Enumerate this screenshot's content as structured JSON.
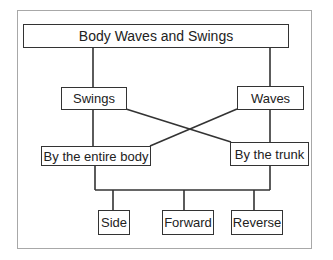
{
  "diagram": {
    "title": "Body Waves and Swings",
    "level1": [
      {
        "id": "swings",
        "label": "Swings"
      },
      {
        "id": "waves",
        "label": "Waves"
      }
    ],
    "level2": [
      {
        "id": "entire-body",
        "label": "By the entire body"
      },
      {
        "id": "trunk",
        "label": "By the trunk"
      }
    ],
    "level3": [
      {
        "id": "side",
        "label": "Side"
      },
      {
        "id": "forward",
        "label": "Forward"
      },
      {
        "id": "reverse",
        "label": "Reverse"
      }
    ],
    "edges": [
      [
        "Body Waves and Swings",
        "Swings"
      ],
      [
        "Body Waves and Swings",
        "Waves"
      ],
      [
        "Swings",
        "By the entire body"
      ],
      [
        "Swings",
        "By the trunk"
      ],
      [
        "Waves",
        "By the trunk"
      ],
      [
        "Waves",
        "By the entire body"
      ],
      [
        "By the entire body",
        "Side"
      ],
      [
        "By the entire body",
        "Forward"
      ],
      [
        "By the entire body",
        "Reverse"
      ],
      [
        "By the trunk",
        "Side"
      ],
      [
        "By the trunk",
        "Forward"
      ],
      [
        "By the trunk",
        "Reverse"
      ]
    ],
    "colors": {
      "line": "#333333",
      "frame": "#a8a8a8",
      "background": "#ffffff"
    }
  }
}
